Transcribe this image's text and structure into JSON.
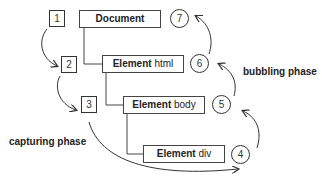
{
  "diagram": {
    "nodes": [
      {
        "strong": "Document",
        "rest": ""
      },
      {
        "strong": "Element",
        "rest": " html"
      },
      {
        "strong": "Element",
        "rest": " body"
      },
      {
        "strong": "Element",
        "rest": " div"
      }
    ],
    "capture_steps": [
      "1",
      "2",
      "3"
    ],
    "target_step": "4",
    "bubble_steps": [
      "5",
      "6",
      "7"
    ],
    "labels": {
      "capturing": "capturing phase",
      "bubbling": "bubbling phase"
    }
  }
}
